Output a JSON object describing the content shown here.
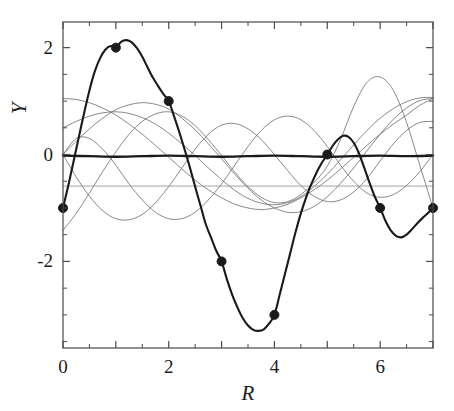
{
  "chart_data": {
    "type": "line",
    "title": "",
    "xlabel": "R",
    "ylabel": "Y",
    "xlim": [
      0,
      7
    ],
    "ylim": [
      -3.62,
      2.48
    ],
    "grid": false,
    "legend": null,
    "xticks": [
      0,
      1,
      2,
      3,
      4,
      5,
      6,
      7
    ],
    "xtick_labels": [
      "0",
      "",
      "2",
      "",
      "4",
      "",
      "6",
      ""
    ],
    "yticks": [
      -3,
      -2,
      -1,
      0,
      1,
      2
    ],
    "ytick_labels": [
      "",
      "-2",
      "",
      "0",
      "",
      "2"
    ],
    "ytick_major": [
      -2,
      0,
      2
    ],
    "ytick_major_labels": [
      "-2",
      "0",
      "2"
    ],
    "marker_points": {
      "x": [
        0,
        1,
        2,
        3,
        4,
        5,
        6,
        7
      ],
      "y": [
        -1,
        2,
        1,
        -2,
        -3,
        0,
        -1,
        -1
      ],
      "marker": "filled-circle",
      "marker_size": 9,
      "color": "#1a1a1a"
    },
    "series": [
      {
        "name": "interpolant",
        "style": "bold-solid",
        "color": "#1a1a1a",
        "width": 2.1,
        "x": [
          0,
          0.1,
          0.2,
          0.3,
          0.4,
          0.5,
          0.6,
          0.7,
          0.8,
          0.9,
          1,
          1.1,
          1.2,
          1.3,
          1.4,
          1.5,
          1.6,
          1.7,
          1.8,
          1.9,
          2,
          2.1,
          2.2,
          2.3,
          2.4,
          2.5,
          2.6,
          2.7,
          2.8,
          2.9,
          3,
          3.1,
          3.2,
          3.3,
          3.4,
          3.5,
          3.6,
          3.7,
          3.8,
          3.9,
          4,
          4.1,
          4.2,
          4.3,
          4.4,
          4.5,
          4.6,
          4.7,
          4.8,
          4.9,
          5,
          5.1,
          5.2,
          5.3,
          5.4,
          5.5,
          5.6,
          5.7,
          5.8,
          5.9,
          6,
          6.1,
          6.2,
          6.3,
          6.4,
          6.5,
          6.6,
          6.7,
          6.8,
          6.9,
          7
        ],
        "y": [
          -1,
          -0.58,
          -0.13,
          0.33,
          0.78,
          1.2,
          1.55,
          1.8,
          1.96,
          2.03,
          2,
          2.11,
          2.14,
          2.1,
          1.99,
          1.83,
          1.63,
          1.44,
          1.28,
          1.13,
          1,
          0.72,
          0.42,
          0.1,
          -0.24,
          -0.6,
          -0.95,
          -1.3,
          -1.55,
          -1.8,
          -2,
          -2.33,
          -2.62,
          -2.86,
          -3.06,
          -3.2,
          -3.28,
          -3.3,
          -3.27,
          -3.16,
          -3,
          -2.62,
          -2.23,
          -1.84,
          -1.45,
          -1.1,
          -0.8,
          -0.55,
          -0.33,
          -0.15,
          0,
          0.16,
          0.28,
          0.35,
          0.33,
          0.22,
          0.02,
          -0.25,
          -0.53,
          -0.79,
          -1,
          -1.24,
          -1.42,
          -1.52,
          -1.55,
          -1.5,
          -1.4,
          -1.29,
          -1.19,
          -1.1,
          -1
        ]
      },
      {
        "name": "basis-1",
        "style": "thin-solid",
        "color": "#6b6b6b",
        "width": 0.8,
        "x": [
          0,
          0.25,
          0.5,
          0.75,
          1,
          1.25,
          1.5,
          1.75,
          2,
          2.25,
          2.5,
          2.75,
          3,
          3.25,
          3.5,
          3.75,
          4,
          4.25,
          4.5,
          4.75,
          5,
          5.25,
          5.5,
          5.75,
          6,
          6.25,
          6.5,
          6.75,
          7
        ],
        "y": [
          1.05,
          1.03,
          0.97,
          0.87,
          0.74,
          0.57,
          0.38,
          0.17,
          -0.05,
          -0.27,
          -0.48,
          -0.66,
          -0.81,
          -0.93,
          -1.0,
          -1.03,
          -1.0,
          -0.93,
          -0.81,
          -0.66,
          -0.48,
          -0.27,
          -0.05,
          0.17,
          0.38,
          0.57,
          0.74,
          0.92,
          1.05
        ]
      },
      {
        "name": "basis-2",
        "style": "thin-solid",
        "color": "#6b6b6b",
        "width": 0.8,
        "x": [
          0,
          0.25,
          0.5,
          0.75,
          1,
          1.25,
          1.5,
          1.75,
          2,
          2.25,
          2.5,
          2.75,
          3,
          3.25,
          3.5,
          3.75,
          4,
          4.25,
          4.5,
          4.75,
          5,
          5.25,
          5.5,
          5.75,
          6,
          6.25,
          6.5,
          6.75,
          7
        ],
        "y": [
          0.5,
          0.62,
          0.72,
          0.78,
          0.8,
          0.77,
          0.69,
          0.57,
          0.4,
          0.2,
          -0.02,
          -0.25,
          -0.47,
          -0.67,
          -0.82,
          -0.91,
          -0.94,
          -0.9,
          -0.79,
          -0.6,
          -0.37,
          -0.1,
          0.18,
          0.45,
          0.68,
          0.86,
          0.99,
          1.06,
          1.07
        ]
      },
      {
        "name": "basis-3",
        "style": "thin-solid",
        "color": "#6b6b6b",
        "width": 0.8,
        "x": [
          0,
          0.25,
          0.5,
          0.75,
          1,
          1.25,
          1.5,
          1.75,
          2,
          2.25,
          2.5,
          2.75,
          3,
          3.25,
          3.5,
          3.75,
          4,
          4.25,
          4.5,
          4.75,
          5,
          5.25,
          5.5,
          5.75,
          6,
          6.25,
          6.5,
          6.75,
          7
        ],
        "y": [
          0.0,
          0.25,
          0.48,
          0.68,
          0.84,
          0.93,
          0.97,
          0.94,
          0.85,
          0.68,
          0.46,
          0.2,
          -0.08,
          -0.37,
          -0.63,
          -0.85,
          -1.0,
          -1.08,
          -1.07,
          -0.97,
          -0.79,
          -0.54,
          -0.25,
          0.07,
          0.38,
          0.66,
          0.87,
          1.01,
          1.05
        ]
      },
      {
        "name": "basis-4",
        "style": "thin-solid",
        "color": "#6b6b6b",
        "width": 0.8,
        "x": [
          0,
          0.25,
          0.5,
          0.75,
          1,
          1.25,
          1.5,
          1.75,
          2,
          2.25,
          2.5,
          2.75,
          3,
          3.25,
          3.5,
          3.75,
          4,
          4.25,
          4.5,
          4.75,
          5,
          5.25,
          5.5,
          5.75,
          6,
          6.25,
          6.5,
          6.75,
          7
        ],
        "y": [
          0.0,
          0.3,
          0.3,
          0.1,
          -0.2,
          -0.55,
          -0.85,
          -1.08,
          -1.2,
          -1.2,
          -1.08,
          -0.85,
          -0.55,
          -0.2,
          0.15,
          0.45,
          0.65,
          0.72,
          0.65,
          0.45,
          0.15,
          -0.2,
          -0.5,
          -0.72,
          -0.8,
          -0.75,
          -0.58,
          -0.32,
          0.0
        ]
      },
      {
        "name": "basis-5",
        "style": "thin-solid",
        "color": "#6b6b6b",
        "width": 0.8,
        "x": [
          0,
          0.25,
          0.5,
          0.75,
          1,
          1.25,
          1.5,
          1.75,
          2,
          2.25,
          2.5,
          2.75,
          3,
          3.25,
          3.5,
          3.75,
          4,
          4.25,
          4.5,
          4.75,
          5,
          5.25,
          5.5,
          5.75,
          6,
          6.25,
          6.5,
          6.75,
          7
        ],
        "y": [
          -1.42,
          -1.1,
          -0.72,
          -0.32,
          0.05,
          0.38,
          0.62,
          0.76,
          0.8,
          0.72,
          0.54,
          0.28,
          -0.02,
          -0.33,
          -0.6,
          -0.8,
          -0.9,
          -0.88,
          -0.75,
          -0.52,
          -0.22,
          0.28,
          0.9,
          1.35,
          1.45,
          1.2,
          0.6,
          -0.2,
          -1.0
        ]
      },
      {
        "name": "basis-6",
        "style": "thin-solid",
        "color": "#6b6b6b",
        "width": 0.8,
        "x": [
          0,
          0.25,
          0.5,
          0.75,
          1,
          1.25,
          1.5,
          1.75,
          2,
          2.25,
          2.5,
          2.75,
          3,
          3.25,
          3.5,
          3.75,
          4,
          4.25,
          4.5,
          4.75,
          5,
          5.25,
          5.5,
          5.75,
          6,
          6.25,
          6.5,
          6.75,
          7
        ],
        "y": [
          0.0,
          -0.42,
          -0.78,
          -1.05,
          -1.2,
          -1.22,
          -1.12,
          -0.9,
          -0.6,
          -0.25,
          0.1,
          0.38,
          0.55,
          0.58,
          0.48,
          0.28,
          0.0,
          -0.3,
          -0.58,
          -0.78,
          -0.88,
          -0.85,
          -0.7,
          -0.45,
          -0.12,
          0.2,
          0.45,
          0.6,
          0.62
        ]
      },
      {
        "name": "near-zero-flat",
        "style": "bold-solid",
        "color": "#1a1a1a",
        "width": 2.4,
        "x": [
          0,
          0.5,
          1,
          1.5,
          2,
          2.5,
          3,
          3.5,
          4,
          4.5,
          5,
          5.5,
          6,
          6.5,
          7
        ],
        "y": [
          -0.02,
          -0.03,
          -0.04,
          -0.03,
          -0.02,
          -0.03,
          -0.04,
          -0.03,
          -0.02,
          -0.03,
          -0.04,
          -0.03,
          -0.02,
          -0.03,
          -0.02
        ]
      },
      {
        "name": "horizontal-reference",
        "style": "thin-solid",
        "color": "#8a8a8a",
        "width": 0.8,
        "x": [
          0,
          7
        ],
        "y": [
          -0.59,
          -0.59
        ]
      }
    ]
  },
  "axes": {
    "frame_color": "#4a4a4a",
    "tick_color": "#4a4a4a"
  }
}
